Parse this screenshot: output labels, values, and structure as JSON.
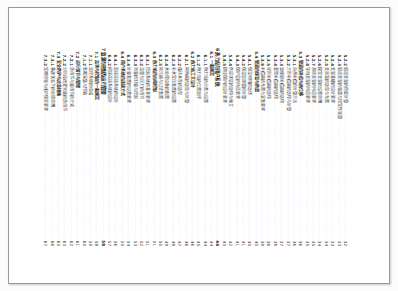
{
  "document": {
    "kind": "scanned-page",
    "page_type": "table-of-contents",
    "orientation": "rotated-90-clockwise",
    "background_color": "#ffffff",
    "frame_color": "#9a9a9a",
    "text_color": "#3d3d3d",
    "leader_char": "."
  },
  "toc": {
    "entries": [
      {
        "number": "5.2.2",
        "title": "管道支架的荷载计算",
        "page": "32",
        "level": 2,
        "style": "normal"
      },
      {
        "number": "5.2.3",
        "title": "管道支架的强度与稳定性验算",
        "page": "33",
        "level": 2,
        "style": "normal"
      },
      {
        "number": "5.2.4",
        "title": "支架基础的设计要求",
        "page": "33",
        "level": 2,
        "style": "normal"
      },
      {
        "number": "5.2.5",
        "title": "支吊架的选型与布置",
        "page": "34",
        "level": 2,
        "style": "normal"
      },
      {
        "number": "5.2.6",
        "title": "固定支架的设置原则",
        "page": "34",
        "level": 2,
        "style": "normal"
      },
      {
        "number": "5.2.7",
        "title": "滑动支架的构造要求",
        "page": "35",
        "level": 2,
        "style": "normal"
      },
      {
        "number": "5.2.8",
        "title": "导向支架的构造要求",
        "page": "35",
        "level": 2,
        "style": "normal"
      },
      {
        "number": "5.3",
        "title": "管道的补偿与热位移",
        "page": "36",
        "level": 1,
        "style": "section"
      },
      {
        "number": "5.3.1",
        "title": "自然补偿的计算方法",
        "page": "36",
        "level": 2,
        "style": "normal"
      },
      {
        "number": "5.3.2",
        "title": "方形补偿器的选用与计算",
        "page": "37",
        "level": 2,
        "style": "normal"
      },
      {
        "number": "5.3.3",
        "title": "波纹管补偿器的选用",
        "page": "37",
        "level": 2,
        "style": "normal"
      },
      {
        "number": "5.3.4",
        "title": "套筒补偿器的选用",
        "page": "38",
        "level": 2,
        "style": "normal"
      },
      {
        "number": "5.3.5",
        "title": "球形补偿器的选用",
        "page": "38",
        "level": 2,
        "style": "normal"
      },
      {
        "number": "5.3.6",
        "title": "补偿器的布置与安装要求",
        "page": "39",
        "level": 2,
        "style": "normal"
      },
      {
        "number": "5.4",
        "title": "管道的保温与防腐",
        "page": "40",
        "level": 1,
        "style": "section"
      },
      {
        "number": "5.4.1",
        "title": "保温材料的选择",
        "page": "40",
        "level": 2,
        "style": "normal"
      },
      {
        "number": "5.4.2",
        "title": "保温层厚度的计算",
        "page": "41",
        "level": 2,
        "style": "normal"
      },
      {
        "number": "5.4.3",
        "title": "保护层的构造要求",
        "page": "41",
        "level": 2,
        "style": "normal"
      },
      {
        "number": "5.4.4",
        "title": "防腐涂层的选用与施工",
        "page": "42",
        "level": 2,
        "style": "normal"
      },
      {
        "number": "5.4.5",
        "title": "阴极保护的设计要求",
        "page": "43",
        "level": 2,
        "style": "normal"
      },
      {
        "number": "6",
        "title": "热力站与用户系统",
        "page": "44",
        "level": 0,
        "style": "chapter"
      },
      {
        "number": "6.1",
        "title": "一般规定",
        "page": "44",
        "level": 1,
        "style": "section"
      },
      {
        "number": "6.1.1",
        "title": "热力站的分类与设置",
        "page": "44",
        "level": 2,
        "style": "normal"
      },
      {
        "number": "6.1.2",
        "title": "热力站的位置选择",
        "page": "45",
        "level": 2,
        "style": "normal"
      },
      {
        "number": "6.2",
        "title": "热力站工艺设计",
        "page": "46",
        "level": 1,
        "style": "section"
      },
      {
        "number": "6.2.1",
        "title": "换热器的选型与计算",
        "page": "46",
        "level": 2,
        "style": "normal"
      },
      {
        "number": "6.2.2",
        "title": "循环水泵的选型",
        "page": "47",
        "level": 2,
        "style": "normal"
      },
      {
        "number": "6.2.3",
        "title": "补水定压装置的设置",
        "page": "48",
        "level": 2,
        "style": "normal"
      },
      {
        "number": "6.2.4",
        "title": "水处理设备的配置",
        "page": "49",
        "level": 2,
        "style": "normal"
      },
      {
        "number": "6.2.5",
        "title": "除污器与过滤装置",
        "page": "50",
        "level": 2,
        "style": "normal"
      },
      {
        "number": "6.3",
        "title": "热力站的自动控制",
        "page": "51",
        "level": 1,
        "style": "section"
      },
      {
        "number": "6.3.1",
        "title": "控制系统的基本要求",
        "page": "51",
        "level": 2,
        "style": "normal"
      },
      {
        "number": "6.3.2",
        "title": "温度与压力的调节",
        "page": "52",
        "level": 2,
        "style": "normal"
      },
      {
        "number": "6.3.3",
        "title": "流量的测量与控制",
        "page": "53",
        "level": 2,
        "style": "normal"
      },
      {
        "number": "6.3.4",
        "title": "计量装置的设置要求",
        "page": "54",
        "level": 2,
        "style": "normal"
      },
      {
        "number": "6.4",
        "title": "用户系统的连接方式",
        "page": "55",
        "level": 1,
        "style": "section"
      },
      {
        "number": "6.4.1",
        "title": "直接连接系统的设计",
        "page": "56",
        "level": 2,
        "style": "normal"
      },
      {
        "number": "6.4.2",
        "title": "间接连接系统的设计",
        "page": "57",
        "level": 2,
        "style": "normal"
      },
      {
        "number": "7",
        "title": "监测与控制及运行管理",
        "page": "58",
        "level": 0,
        "style": "chapter"
      },
      {
        "number": "7.1",
        "title": "监测与控制的一般规定",
        "page": "58",
        "level": 1,
        "style": "section"
      },
      {
        "number": "7.1.1",
        "title": "监控系统的组成",
        "page": "59",
        "level": 2,
        "style": "normal"
      },
      {
        "number": "7.1.2",
        "title": "数据采集与传输",
        "page": "60",
        "level": 2,
        "style": "normal"
      },
      {
        "number": "7.2",
        "title": "运行调节与管理",
        "page": "61",
        "level": 1,
        "style": "section"
      },
      {
        "number": "7.2.1",
        "title": "质调节与量调节的方式",
        "page": "62",
        "level": 2,
        "style": "normal"
      },
      {
        "number": "7.2.2",
        "title": "分阶段改变流量的质调节",
        "page": "63",
        "level": 2,
        "style": "normal"
      },
      {
        "number": "7.3",
        "title": "安全防护与应急措施",
        "page": "65",
        "level": 1,
        "style": "section"
      },
      {
        "number": "7.3.1",
        "title": "事故状态下的处理原则",
        "page": "66",
        "level": 2,
        "style": "normal"
      },
      {
        "number": "7.3.2",
        "title": "定期检验与维护保养要求",
        "page": "67",
        "level": 2,
        "style": "normal"
      }
    ]
  }
}
